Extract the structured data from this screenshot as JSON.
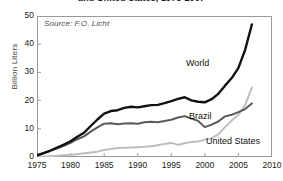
{
  "figure": {
    "title": "and United States, 1975-2007",
    "source_note": "Source: F.O. Licht",
    "width": 283,
    "height": 181,
    "background": "#ffffff",
    "frame_color": "#9a9a9a"
  },
  "labels": {
    "world": "World",
    "brazil": "Brazil",
    "united_states": "United States"
  },
  "chart_data": {
    "type": "line",
    "title": "and United States, 1975-2007",
    "subtitle": "",
    "xlabel": "",
    "ylabel": "Billion Liters",
    "xlim": [
      1975,
      2010
    ],
    "ylim": [
      0,
      50
    ],
    "xticks": [
      1975,
      1980,
      1985,
      1990,
      1995,
      2000,
      2005,
      2010
    ],
    "yticks": [
      0,
      10,
      20,
      30,
      40,
      50
    ],
    "xtick_labels": [
      "1975",
      "1980",
      "1985",
      "1990",
      "1995",
      "2000",
      "2005",
      "2010"
    ],
    "ytick_labels": [
      "0",
      "10",
      "20",
      "30",
      "40",
      "50"
    ],
    "grid": false,
    "legend": "inline-annotations",
    "annotations": [
      {
        "text": "Source: F.O. Licht",
        "x": 1976,
        "y": 47,
        "style": "italic"
      },
      {
        "text": "World",
        "x": 2001,
        "y": 31
      },
      {
        "text": "Brazil",
        "x": 2001.4,
        "y": 13.5
      },
      {
        "text": "United States",
        "x": 2003.5,
        "y": 4.5
      }
    ],
    "x": [
      1975,
      1976,
      1977,
      1978,
      1979,
      1980,
      1981,
      1982,
      1983,
      1984,
      1985,
      1986,
      1987,
      1988,
      1989,
      1990,
      1991,
      1992,
      1993,
      1994,
      1995,
      1996,
      1997,
      1998,
      1999,
      2000,
      2001,
      2002,
      2003,
      2004,
      2005,
      2006,
      2007
    ],
    "series": [
      {
        "name": "World",
        "color": "#111111",
        "width": 2.4,
        "values": [
          0.6,
          1.4,
          2.3,
          3.3,
          4.4,
          5.6,
          7.2,
          8.6,
          11.0,
          13.3,
          15.4,
          16.3,
          16.6,
          17.4,
          17.8,
          17.6,
          18.0,
          18.4,
          18.5,
          19.1,
          19.8,
          20.6,
          21.2,
          20.1,
          19.6,
          19.4,
          20.5,
          22.4,
          25.3,
          28.0,
          31.6,
          38.0,
          47.0
        ]
      },
      {
        "name": "Brazil",
        "color": "#5a5a5a",
        "width": 2.0,
        "values": [
          0.6,
          1.4,
          2.2,
          3.1,
          4.0,
          5.0,
          6.3,
          7.3,
          9.0,
          10.5,
          11.8,
          12.0,
          11.6,
          11.9,
          12.0,
          11.8,
          12.3,
          12.5,
          12.3,
          12.8,
          13.2,
          14.0,
          14.5,
          13.6,
          12.8,
          10.6,
          11.5,
          12.6,
          14.4,
          15.0,
          15.9,
          17.0,
          19.0
        ]
      },
      {
        "name": "United States",
        "color": "#bdbdbd",
        "width": 2.0,
        "values": [
          0.1,
          0.2,
          0.3,
          0.4,
          0.6,
          0.8,
          1.0,
          1.3,
          1.6,
          1.9,
          2.5,
          2.8,
          3.2,
          3.3,
          3.4,
          3.5,
          3.6,
          3.8,
          4.2,
          4.6,
          5.0,
          4.3,
          4.9,
          5.3,
          5.5,
          6.1,
          6.7,
          8.0,
          10.6,
          12.9,
          15.0,
          18.4,
          24.6
        ]
      }
    ]
  }
}
